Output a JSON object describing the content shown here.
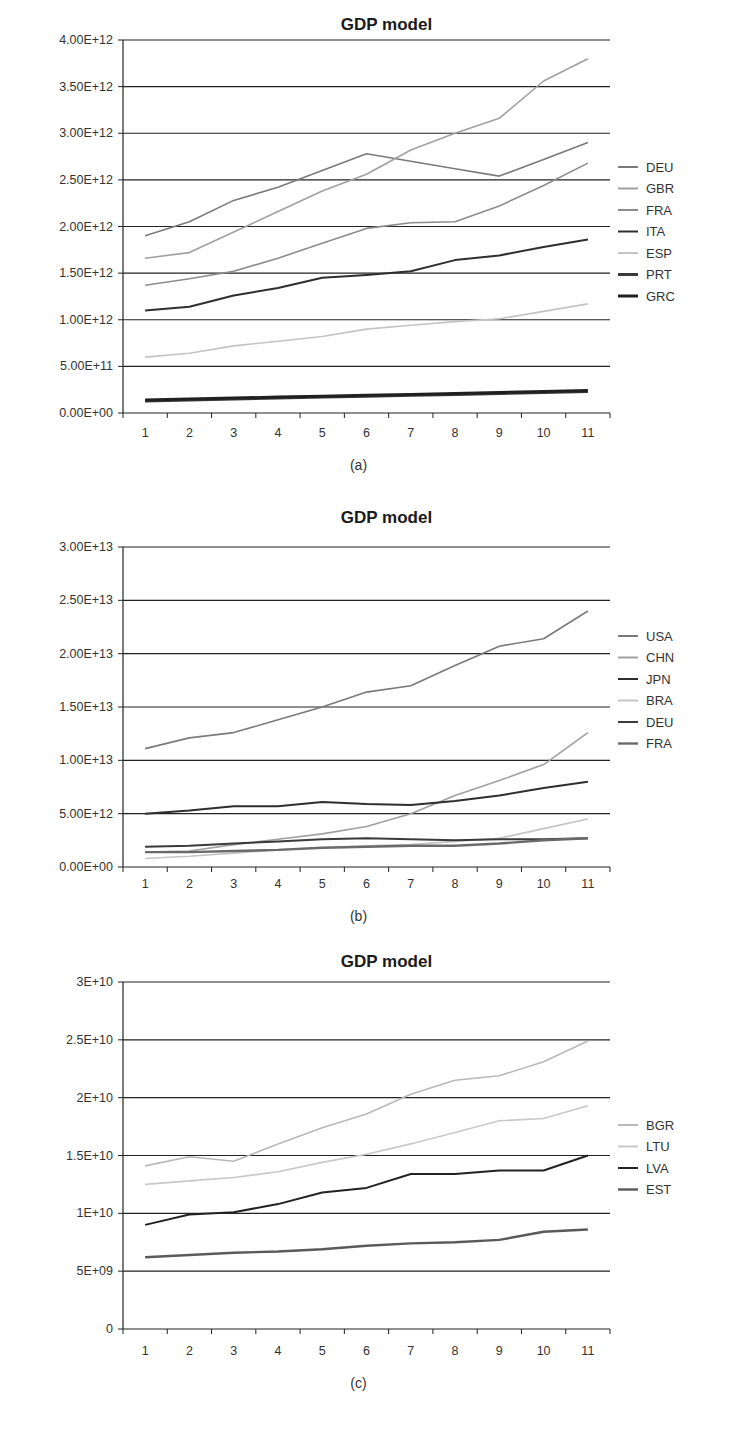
{
  "chart_data": [
    {
      "id": "a",
      "type": "line",
      "title": "GDP model",
      "caption": "(a)",
      "xlabel": "",
      "ylabel": "",
      "x": [
        1,
        2,
        3,
        4,
        5,
        6,
        7,
        8,
        9,
        10,
        11
      ],
      "yticks": [
        "0.00E+00",
        "5.00E+11",
        "1.00E+12",
        "1.50E+12",
        "2.00E+12",
        "2.50E+12",
        "3.00E+12",
        "3.50E+12",
        "4.00E+12"
      ],
      "ylim": [
        0,
        4000000000000.0
      ],
      "grid": true,
      "legend_position": "right",
      "series": [
        {
          "name": "DEU",
          "color": "#7a7a7a",
          "width": 1.6,
          "values": [
            1900000000000.0,
            2050000000000.0,
            2280000000000.0,
            2420000000000.0,
            2600000000000.0,
            2780000000000.0,
            2700000000000.0,
            2620000000000.0,
            2540000000000.0,
            2720000000000.0,
            2900000000000.0
          ]
        },
        {
          "name": "GBR",
          "color": "#a0a0a0",
          "width": 1.6,
          "values": [
            1660000000000.0,
            1720000000000.0,
            1940000000000.0,
            2160000000000.0,
            2380000000000.0,
            2560000000000.0,
            2820000000000.0,
            3000000000000.0,
            3160000000000.0,
            3560000000000.0,
            3800000000000.0
          ]
        },
        {
          "name": "FRA",
          "color": "#8c8c8c",
          "width": 1.6,
          "values": [
            1370000000000.0,
            1440000000000.0,
            1520000000000.0,
            1660000000000.0,
            1820000000000.0,
            1980000000000.0,
            2040000000000.0,
            2050000000000.0,
            2220000000000.0,
            2440000000000.0,
            2680000000000.0
          ]
        },
        {
          "name": "ITA",
          "color": "#2e2e2e",
          "width": 2,
          "values": [
            1100000000000.0,
            1140000000000.0,
            1260000000000.0,
            1340000000000.0,
            1450000000000.0,
            1480000000000.0,
            1520000000000.0,
            1640000000000.0,
            1690000000000.0,
            1780000000000.0,
            1860000000000.0
          ]
        },
        {
          "name": "ESP",
          "color": "#c4c4c4",
          "width": 1.6,
          "values": [
            600000000000.0,
            640000000000.0,
            720000000000.0,
            770000000000.0,
            820000000000.0,
            900000000000.0,
            940000000000.0,
            980000000000.0,
            1010000000000.0,
            1090000000000.0,
            1170000000000.0
          ]
        },
        {
          "name": "PRT",
          "color": "#3a3a3a",
          "width": 3,
          "values": [
            130000000000.0,
            140000000000.0,
            150000000000.0,
            160000000000.0,
            170000000000.0,
            180000000000.0,
            190000000000.0,
            200000000000.0,
            210000000000.0,
            220000000000.0,
            230000000000.0
          ]
        },
        {
          "name": "GRC",
          "color": "#202020",
          "width": 3,
          "values": [
            140000000000.0,
            150000000000.0,
            160000000000.0,
            170000000000.0,
            180000000000.0,
            190000000000.0,
            200000000000.0,
            210000000000.0,
            220000000000.0,
            230000000000.0,
            240000000000.0
          ]
        }
      ]
    },
    {
      "id": "b",
      "type": "line",
      "title": "GDP model",
      "caption": "(b)",
      "xlabel": "",
      "ylabel": "",
      "x": [
        1,
        2,
        3,
        4,
        5,
        6,
        7,
        8,
        9,
        10,
        11
      ],
      "yticks": [
        "0.00E+00",
        "5.00E+12",
        "1.00E+13",
        "1.50E+13",
        "2.00E+13",
        "2.50E+13",
        "3.00E+13"
      ],
      "ylim": [
        0,
        30000000000000.0
      ],
      "grid": true,
      "legend_position": "right",
      "series": [
        {
          "name": "USA",
          "color": "#7a7a7a",
          "width": 1.6,
          "values": [
            11100000000000.0,
            12100000000000.0,
            12600000000000.0,
            13800000000000.0,
            15000000000000.0,
            16400000000000.0,
            17000000000000.0,
            18900000000000.0,
            20700000000000.0,
            21400000000000.0,
            24000000000000.0
          ]
        },
        {
          "name": "CHN",
          "color": "#a0a0a0",
          "width": 1.6,
          "values": [
            1400000000000.0,
            1500000000000.0,
            2100000000000.0,
            2600000000000.0,
            3100000000000.0,
            3800000000000.0,
            5000000000000.0,
            6700000000000.0,
            8100000000000.0,
            9600000000000.0,
            12600000000000.0
          ]
        },
        {
          "name": "JPN",
          "color": "#2e2e2e",
          "width": 2,
          "values": [
            5000000000000.0,
            5300000000000.0,
            5700000000000.0,
            5700000000000.0,
            6100000000000.0,
            5900000000000.0,
            5800000000000.0,
            6200000000000.0,
            6700000000000.0,
            7400000000000.0,
            8000000000000.0
          ]
        },
        {
          "name": "BRA",
          "color": "#c4c4c4",
          "width": 1.6,
          "values": [
            800000000000.0,
            1000000000000.0,
            1300000000000.0,
            1600000000000.0,
            1800000000000.0,
            2000000000000.0,
            2100000000000.0,
            2400000000000.0,
            2700000000000.0,
            3600000000000.0,
            4500000000000.0
          ]
        },
        {
          "name": "DEU",
          "color": "#3a3a3a",
          "width": 2,
          "values": [
            1900000000000.0,
            2000000000000.0,
            2200000000000.0,
            2400000000000.0,
            2600000000000.0,
            2700000000000.0,
            2600000000000.0,
            2500000000000.0,
            2600000000000.0,
            2600000000000.0,
            2700000000000.0
          ]
        },
        {
          "name": "FRA",
          "color": "#6a6a6a",
          "width": 2.4,
          "values": [
            1400000000000.0,
            1400000000000.0,
            1500000000000.0,
            1600000000000.0,
            1800000000000.0,
            1900000000000.0,
            2000000000000.0,
            2000000000000.0,
            2200000000000.0,
            2500000000000.0,
            2700000000000.0
          ]
        }
      ]
    },
    {
      "id": "c",
      "type": "line",
      "title": "GDP model",
      "caption": "(c)",
      "xlabel": "",
      "ylabel": "",
      "x": [
        1,
        2,
        3,
        4,
        5,
        6,
        7,
        8,
        9,
        10,
        11
      ],
      "yticks": [
        "0",
        "5E+09",
        "1E+10",
        "1.5E+10",
        "2E+10",
        "2.5E+10",
        "3E+10"
      ],
      "ylim": [
        0,
        30000000000.0
      ],
      "grid": true,
      "legend_position": "right",
      "series": [
        {
          "name": "BGR",
          "color": "#b8b8b8",
          "width": 1.6,
          "values": [
            14100000000.0,
            14900000000.0,
            14500000000.0,
            16000000000.0,
            17400000000.0,
            18600000000.0,
            20300000000.0,
            21500000000.0,
            21900000000.0,
            23100000000.0,
            24900000000.0
          ]
        },
        {
          "name": "LTU",
          "color": "#c8c8c8",
          "width": 1.6,
          "values": [
            12500000000.0,
            12800000000.0,
            13100000000.0,
            13600000000.0,
            14400000000.0,
            15100000000.0,
            16000000000.0,
            17000000000.0,
            18000000000.0,
            18200000000.0,
            19300000000.0
          ]
        },
        {
          "name": "LVA",
          "color": "#222222",
          "width": 2,
          "values": [
            9000000000.0,
            9900000000.0,
            10100000000.0,
            10800000000.0,
            11800000000.0,
            12200000000.0,
            13400000000.0,
            13400000000.0,
            13700000000.0,
            13700000000.0,
            15000000000.0
          ]
        },
        {
          "name": "EST",
          "color": "#5a5a5a",
          "width": 2.4,
          "values": [
            6200000000.0,
            6400000000.0,
            6600000000.0,
            6700000000.0,
            6900000000.0,
            7200000000.0,
            7400000000.0,
            7500000000.0,
            7700000000.0,
            8400000000.0,
            8600000000.0
          ]
        }
      ]
    }
  ],
  "layout": [
    {
      "top": 0,
      "height": 480,
      "plot_left": 123,
      "plot_right": 610,
      "plot_top": 40,
      "plot_bottom": 413,
      "title_y": 30,
      "tick_label_y": 437,
      "caption_y": 470,
      "legend_x": 618,
      "legend_y": 167,
      "legend_step": 21.5
    },
    {
      "top": 480,
      "height": 455,
      "plot_left": 123,
      "plot_right": 610,
      "plot_top": 67,
      "plot_bottom": 387,
      "title_y": 43,
      "tick_label_y": 408,
      "caption_y": 441,
      "legend_x": 618,
      "legend_y": 156,
      "legend_step": 21.5
    },
    {
      "top": 935,
      "height": 509,
      "plot_left": 123,
      "plot_right": 610,
      "plot_top": 47,
      "plot_bottom": 394,
      "title_y": 32,
      "tick_label_y": 420,
      "caption_y": 453,
      "legend_x": 618,
      "legend_y": 190,
      "legend_step": 21.5
    }
  ]
}
